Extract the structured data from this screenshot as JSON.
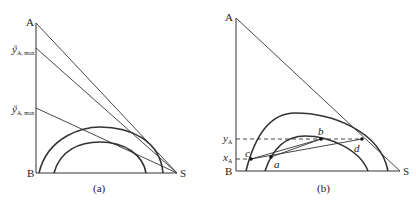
{
  "panel_a": {
    "caption": "(a)",
    "vertices": {
      "top": "A",
      "bottom_left": "B",
      "right": "S"
    },
    "labels": [
      {
        "main": "y",
        "sup": "o",
        "sub": "A, max"
      },
      {
        "main": "y",
        "sup": "o",
        "sub": "A, max"
      }
    ]
  },
  "panel_b": {
    "caption": "(b)",
    "vertices": {
      "top": "A",
      "bottom_left": "B",
      "right": "S"
    },
    "axis_labels": [
      {
        "main": "y",
        "sub": "A"
      },
      {
        "main": "x",
        "sub": "A"
      }
    ],
    "points": [
      "a",
      "b",
      "c",
      "d"
    ]
  },
  "colors": {
    "line": "#333333",
    "curve": "#222222",
    "background": "#ffffff"
  }
}
